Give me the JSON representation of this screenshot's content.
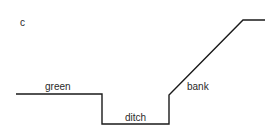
{
  "diagram": {
    "panel_label": "c",
    "labels": {
      "green": "green",
      "ditch": "ditch",
      "bank": "bank"
    },
    "profile_points": "16,94 102,94 102,124 169,124 169,95 243,20 265,20",
    "line_color": "#1a1a1a"
  }
}
